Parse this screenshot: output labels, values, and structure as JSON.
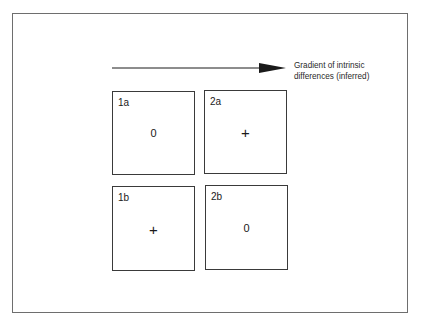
{
  "diagram": {
    "arrow": {
      "label_line1": "Gradient of intrinsic",
      "label_line2": "differences (inferred)",
      "direction": "left-to-right"
    },
    "cells": [
      {
        "id": "1a",
        "label": "1a",
        "value": "0",
        "row": 1,
        "col": 1
      },
      {
        "id": "2a",
        "label": "2a",
        "value": "+",
        "row": 1,
        "col": 2
      },
      {
        "id": "1b",
        "label": "1b",
        "value": "+",
        "row": 2,
        "col": 1
      },
      {
        "id": "2b",
        "label": "2b",
        "value": "0",
        "row": 2,
        "col": 2
      }
    ]
  },
  "colors": {
    "frame_border": "#6e6e6e",
    "cell_border": "#3a3a3a",
    "text": "#1a1a1a",
    "background": "#ffffff"
  }
}
